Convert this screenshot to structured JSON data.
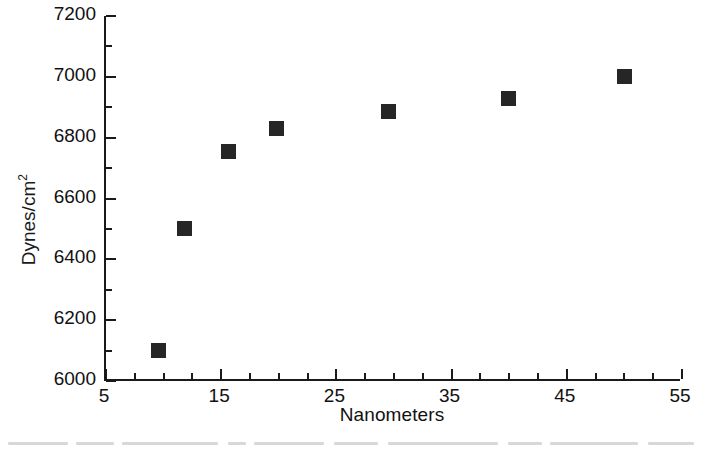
{
  "chart_data": {
    "type": "scatter",
    "title": "",
    "xlabel": "Nanometers",
    "ylabel": "Dynes/cm",
    "ylabel_exponent": "2",
    "xlim": [
      5,
      55
    ],
    "ylim": [
      6000,
      7200
    ],
    "xticks": [
      5,
      15,
      25,
      35,
      45,
      55
    ],
    "xtick_labels": [
      "5",
      "15",
      "25",
      "35",
      "45",
      "55"
    ],
    "yticks": [
      6000,
      6200,
      6400,
      6600,
      6800,
      7000,
      7200
    ],
    "ytick_labels": [
      "6000",
      "6200",
      "6400",
      "6600",
      "6800",
      "7000",
      "7200"
    ],
    "x_minor_interval": 2.5,
    "y_minor_interval": 100,
    "grid": false,
    "legend": null,
    "marker": "filled-square",
    "marker_color": "#262626",
    "axis_color": "#1a1a1a",
    "background_color": "#ffffff",
    "series": [
      {
        "name": "Modulus vs particle size",
        "points": [
          {
            "x": 9.6,
            "y": 6100
          },
          {
            "x": 11.8,
            "y": 6500
          },
          {
            "x": 15.6,
            "y": 6755
          },
          {
            "x": 19.8,
            "y": 6830
          },
          {
            "x": 29.5,
            "y": 6885
          },
          {
            "x": 39.9,
            "y": 6930
          },
          {
            "x": 50.0,
            "y": 7000
          }
        ]
      }
    ]
  }
}
